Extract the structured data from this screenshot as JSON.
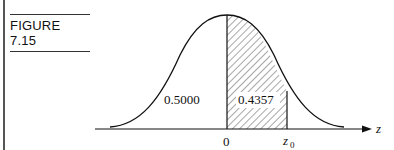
{
  "figure": {
    "label": "FIGURE 7.15"
  },
  "diagram": {
    "type": "normal-curve-area",
    "left_area_label": "0.5000",
    "shaded_area_label": "0.4357",
    "axis_label": "z",
    "tick_zero": "0",
    "tick_z0": "z",
    "tick_z0_sub": "0"
  }
}
